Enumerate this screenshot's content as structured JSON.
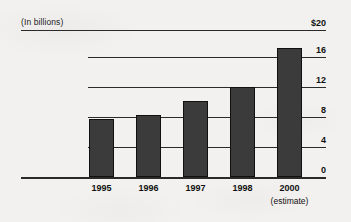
{
  "chart_data": {
    "type": "bar",
    "title": "(In billions)",
    "subtitle": "",
    "xlabel": "",
    "ylabel": "",
    "categories": [
      "1995",
      "1996",
      "1997",
      "1998",
      "2000"
    ],
    "category_sublabels": [
      "",
      "",
      "",
      "",
      "(estimate)"
    ],
    "values": [
      7.9,
      8.4,
      10.4,
      12.2,
      17.6
    ],
    "series": [
      {
        "name": "Value",
        "values": [
          7.9,
          8.4,
          10.4,
          12.2,
          17.6
        ]
      }
    ],
    "ylim": [
      0,
      20
    ],
    "ytick_values": [
      0,
      4,
      8,
      12,
      16,
      20
    ],
    "ytick_labels": [
      "0",
      "4",
      "8",
      "12",
      "16",
      "$20"
    ],
    "grid": true,
    "grid_axis": "y",
    "legend": false,
    "legend_position": "none",
    "annotations": [
      "(estimate)"
    ],
    "colors": {
      "bar_fill": "#3b3b3b",
      "bar_border": "#101010",
      "gridline": "#2a2a2a",
      "axis": "#2a2a2a",
      "text": "#111111",
      "background": "#f3f1ef"
    }
  }
}
